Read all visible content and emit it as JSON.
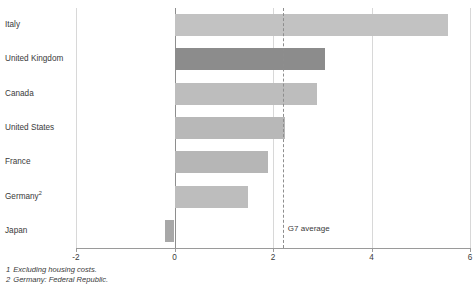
{
  "title": "",
  "chart_data": {
    "type": "bar",
    "orientation": "horizontal",
    "title": "",
    "xlabel": "",
    "ylabel": "",
    "xlim": [
      -2,
      6
    ],
    "xticks": [
      -2,
      0,
      2,
      4,
      6
    ],
    "xtick_labels": [
      "-2",
      "0",
      "2",
      "4",
      "6"
    ],
    "grid": true,
    "grid_axis": "x",
    "legend": false,
    "categories": [
      "Italy",
      "United Kingdom",
      "Canada",
      "United States",
      "France",
      "Germany",
      "Japan"
    ],
    "category_labels": [
      "Italy",
      "United Kingdom",
      "Canada",
      "United States",
      "France",
      "Germany",
      "Japan"
    ],
    "values": [
      5.55,
      3.05,
      2.9,
      2.25,
      1.9,
      1.5,
      -0.2
    ],
    "bar_colors": [
      "#c2c2c2",
      "#8c8c8c",
      "#bdbdbd",
      "#b8b8b8",
      "#b6b6b6",
      "#bdbdbd",
      "#a8a8a8"
    ],
    "highlight_index": 1,
    "annotations": [
      {
        "name": "g7-average",
        "label": "G7 average",
        "value": 2.2,
        "style": "dashed-vertical-line"
      }
    ]
  },
  "footnotes": [
    {
      "num": "1",
      "text": "Excluding housing costs."
    },
    {
      "num": "2",
      "text": "Germany: Federal Republic."
    }
  ],
  "germany_superscript": "2",
  "colors": {
    "bar_default": "#bdbdbd",
    "bar_highlight": "#8c8c8c",
    "grid": "#d8d8d8",
    "axis": "#9a9a9a",
    "text": "#3a3a3a"
  }
}
